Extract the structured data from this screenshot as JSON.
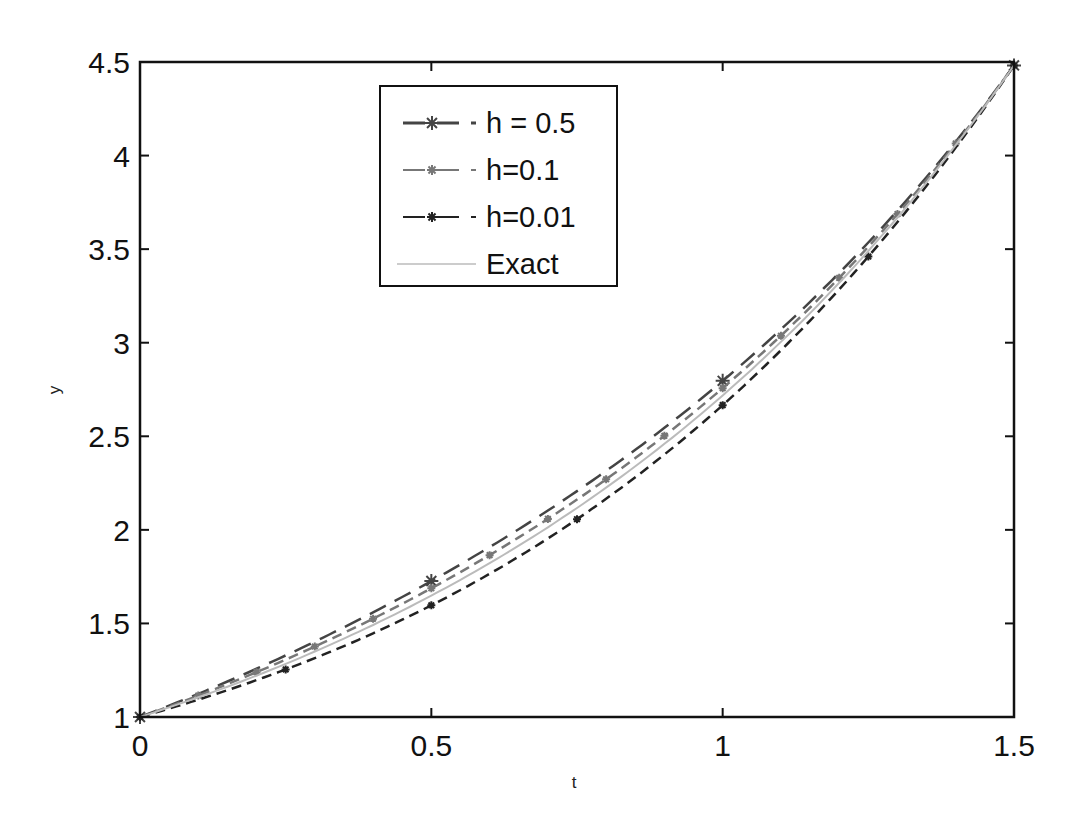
{
  "chart_data": {
    "type": "line",
    "title": "",
    "xlabel": "t",
    "ylabel": "y",
    "xlim": [
      0,
      1.5
    ],
    "ylim": [
      1,
      4.5
    ],
    "grid": false,
    "legend_position": "upper-left-center",
    "xticks": [
      0,
      0.5,
      1,
      1.5
    ],
    "xtick_labels": [
      "0",
      "0.5",
      "1",
      "1.5"
    ],
    "yticks": [
      1,
      1.5,
      2,
      2.5,
      3,
      3.5,
      4,
      4.5
    ],
    "ytick_labels": [
      "1",
      "1.5",
      "2",
      "2.5",
      "3",
      "3.5",
      "4",
      "4.5"
    ],
    "series": [
      {
        "name": "h = 0.5",
        "style": "dashed",
        "marker": "*",
        "color": "#444444",
        "h": 0.5,
        "x": [
          0,
          0.5,
          1.0,
          1.5
        ],
        "y": [
          1.0,
          1.65,
          2.72,
          4.48
        ]
      },
      {
        "name": "h=0.1",
        "style": "dashed",
        "marker": "*",
        "color": "#777777",
        "h": 0.1,
        "x": [
          0,
          0.1,
          0.2,
          0.3,
          0.4,
          0.5,
          0.6,
          0.7,
          0.8,
          0.9,
          1.0,
          1.1,
          1.2,
          1.3,
          1.4,
          1.5
        ],
        "y": [
          1.0,
          1.105,
          1.221,
          1.35,
          1.492,
          1.649,
          1.822,
          2.014,
          2.226,
          2.46,
          2.718,
          3.004,
          3.32,
          3.669,
          4.055,
          4.482
        ]
      },
      {
        "name": "h=0.01",
        "style": "dashed",
        "marker": "*",
        "color": "#222222",
        "h": 0.01,
        "x": [
          0,
          0.25,
          0.5,
          0.75,
          1.0,
          1.25,
          1.5
        ],
        "y": [
          1.0,
          1.284,
          1.649,
          2.117,
          2.718,
          3.49,
          4.482
        ]
      },
      {
        "name": "Exact",
        "style": "solid",
        "marker": "none",
        "color": "#bbbbbb",
        "x": [
          0,
          0.25,
          0.5,
          0.75,
          1.0,
          1.25,
          1.5
        ],
        "y": [
          1.0,
          1.284,
          1.649,
          2.117,
          2.718,
          3.49,
          4.482
        ]
      }
    ]
  }
}
